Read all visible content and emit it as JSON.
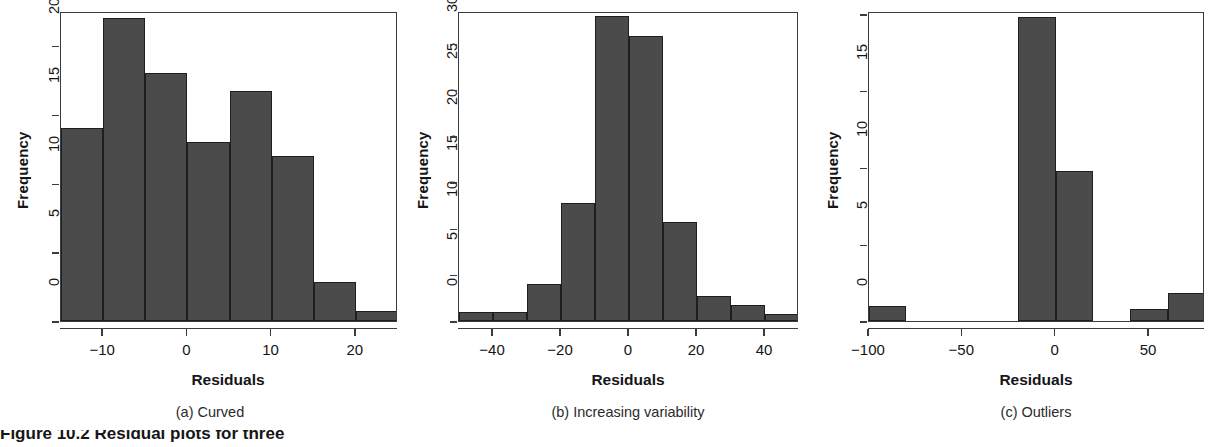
{
  "figure": {
    "caption_clipped": "Figure 10.2  Residual plots for three"
  },
  "panels": [
    {
      "id": "a",
      "subcaption": "(a) Curved",
      "xlabel": "Residuals",
      "ylabel": "Frequency"
    },
    {
      "id": "b",
      "subcaption": "(b) Increasing variability",
      "xlabel": "Residuals",
      "ylabel": "Frequency"
    },
    {
      "id": "c",
      "subcaption": "(c) Outliers",
      "xlabel": "Residuals",
      "ylabel": "Frequency"
    }
  ],
  "chart_data": [
    {
      "type": "bar",
      "title": "(a) Curved",
      "xlabel": "Residuals",
      "ylabel": "Frequency",
      "xlim": [
        -15,
        25
      ],
      "ylim": [
        0,
        22.5
      ],
      "grid": false,
      "legend": "none",
      "bin_width": 5,
      "bin_edges": [
        -15,
        -10,
        -5,
        0,
        5,
        10,
        15,
        20,
        25
      ],
      "categories": [
        "-15 to -10",
        "-10 to -5",
        "-5 to 0",
        "0 to 5",
        "5 to 10",
        "10 to 15",
        "15 to 20",
        "20 to 25"
      ],
      "values": [
        14,
        22,
        18,
        13,
        16.7,
        12,
        2.8,
        0.7
      ],
      "xticks": [
        -10,
        0,
        10,
        20
      ],
      "xticklabels": [
        "−10",
        "0",
        "10",
        "20"
      ],
      "yticks": [
        0,
        5,
        10,
        15,
        20
      ],
      "yticklabels": [
        "0",
        "5",
        "10",
        "15",
        "20"
      ]
    },
    {
      "type": "bar",
      "title": "(b) Increasing variability",
      "xlabel": "Residuals",
      "ylabel": "Frequency",
      "xlim": [
        -50,
        50
      ],
      "ylim": [
        0,
        33.5
      ],
      "grid": false,
      "legend": "none",
      "bin_width": 10,
      "bin_edges": [
        -50,
        -40,
        -30,
        -20,
        -10,
        0,
        10,
        20,
        30,
        40,
        50
      ],
      "categories": [
        "-50 to -40",
        "-40 to -30",
        "-30 to -20",
        "-20 to -10",
        "-10 to 0",
        "0 to 10",
        "10 to 20",
        "20 to 30",
        "30 to 40",
        "40 to 50"
      ],
      "values": [
        1,
        1,
        4,
        12.8,
        33,
        30.8,
        10.7,
        2.7,
        1.7,
        0.8
      ],
      "xticks": [
        -40,
        -20,
        0,
        20,
        40
      ],
      "xticklabels": [
        "−40",
        "−20",
        "0",
        "20",
        "40"
      ],
      "yticks": [
        0,
        5,
        10,
        15,
        20,
        25,
        30
      ],
      "yticklabels": [
        "0",
        "5",
        "10",
        "15",
        "20",
        "25",
        "30"
      ]
    },
    {
      "type": "bar",
      "title": "(c) Outliers",
      "xlabel": "Residuals",
      "ylabel": "Frequency",
      "xlim": [
        -100,
        80
      ],
      "ylim": [
        0,
        20.2
      ],
      "grid": false,
      "legend": "none",
      "bin_width": 20,
      "bin_edges": [
        -100,
        -80,
        -60,
        -40,
        -20,
        0,
        20,
        40,
        60,
        80
      ],
      "categories": [
        "-100 to -80",
        "-80 to -60",
        "-60 to -40",
        "-40 to -20",
        "-20 to 0",
        "0 to 20",
        "20 to 40",
        "40 to 60",
        "60 to 80"
      ],
      "values": [
        1,
        0,
        0,
        0,
        19.8,
        9.8,
        0,
        0.8,
        1.8
      ],
      "xticks": [
        -100,
        -50,
        0,
        50
      ],
      "xticklabels": [
        "−100",
        "−50",
        "0",
        "50"
      ],
      "yticks": [
        0,
        5,
        10,
        15,
        20
      ],
      "yticklabels": [
        "0",
        "5",
        "10",
        "15",
        "20"
      ]
    }
  ],
  "colors": {
    "bar_fill": "#4b4b4b",
    "bar_border": "#1f1f1f",
    "axis": "#3c3c3c",
    "text": "#151515",
    "background": "#ffffff"
  }
}
